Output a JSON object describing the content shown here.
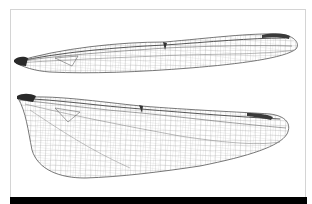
{
  "figure": {
    "panels": [
      {
        "name": "forewing",
        "position": "top"
      },
      {
        "name": "hindwing",
        "position": "bottom"
      }
    ]
  },
  "caption": {
    "text": "",
    "truncated": true
  },
  "colors": {
    "background": "#ffffff",
    "frame": "#d4d4d4",
    "vein": "#6b6b6b",
    "pterostigma": "#3a3a3a",
    "caption_bar": "#000000"
  }
}
